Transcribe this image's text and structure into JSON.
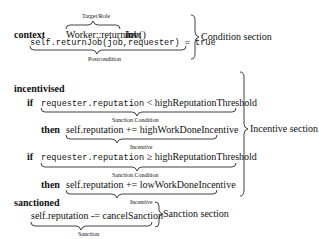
{
  "condition": {
    "keyword": "context",
    "target": "Worker::returnJob()",
    "inv": "inv:",
    "target_label": "Target/Role",
    "postcondition": "self.returnJob(job,requester) = true",
    "postcondition_label": "Postcondition",
    "section_label": "Condition section"
  },
  "incentive": {
    "keyword": "incentivised",
    "if1_kw": "if",
    "if1_mono": "requester.reputation",
    "if1_rest": " < highReputationThreshold",
    "cond_label": "Sanction Condition",
    "then1_kw": "then",
    "then1": "self.reputation += highWorkDoneIncentive",
    "inc_label": "Incentive",
    "if2_kw": "if",
    "if2_mono": "requester.reputation",
    "if2_rest": " ≥ highReputationThreshold",
    "then2_kw": "then",
    "then2": "self.reputation += lowWorkDoneIncentive",
    "section_label": "Incentive section"
  },
  "sanction": {
    "keyword": "sanctioned",
    "body": "self.reputation -= cancelSanction",
    "label": "Sanction",
    "section_label": "Sanction section"
  }
}
